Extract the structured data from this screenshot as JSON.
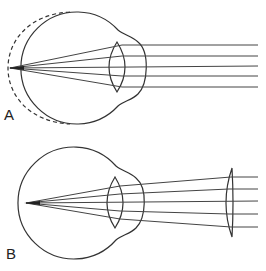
{
  "figure": {
    "panels": [
      {
        "label": "A",
        "caption": "Elongated eyeball (dashed outline) focuses parallel rays in front of retina",
        "rays": 5
      },
      {
        "label": "B",
        "caption": "Corrective concave lens diverges rays to focus on retina",
        "rays": 5
      }
    ]
  }
}
